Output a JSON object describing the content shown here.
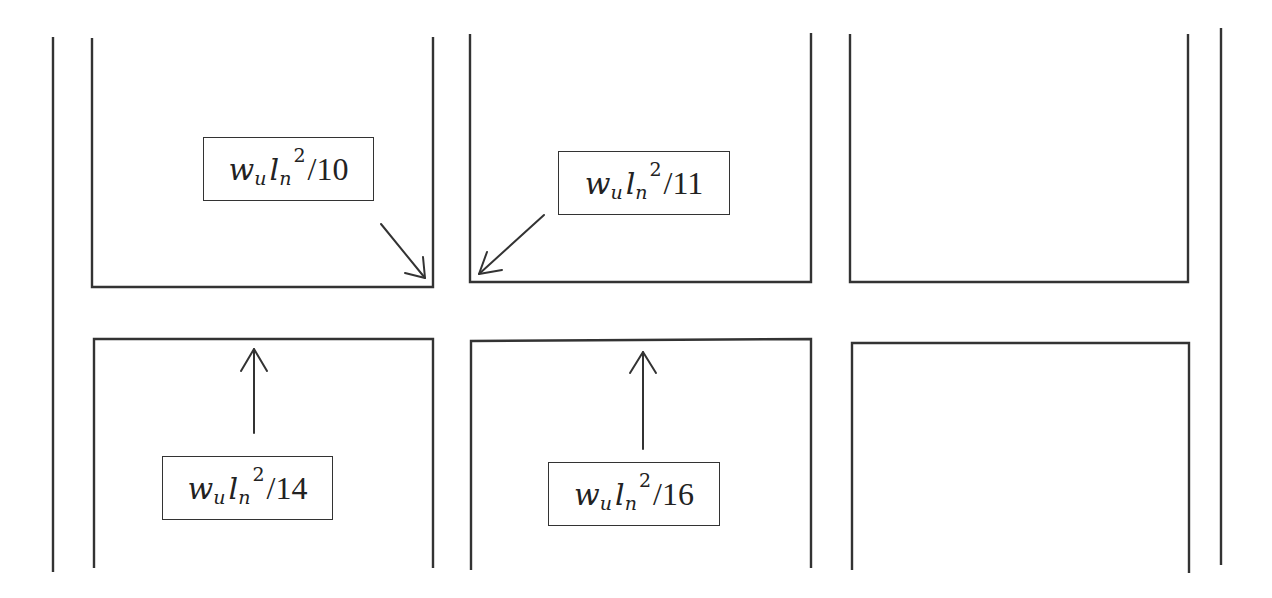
{
  "diagram": {
    "title": "",
    "moment_labels": [
      {
        "id": "top-left-negative",
        "w": "w",
        "w_sub": "u",
        "l": "l",
        "l_sub": "n",
        "exp": "2",
        "divisor": "/10",
        "text": "w_u l_n^2/10"
      },
      {
        "id": "top-middle-negative",
        "w": "w",
        "w_sub": "u",
        "l": "l",
        "l_sub": "n",
        "exp": "2",
        "divisor": "/11",
        "text": "w_u l_n^2/11"
      },
      {
        "id": "bottom-left-positive",
        "w": "w",
        "w_sub": "u",
        "l": "l",
        "l_sub": "n",
        "exp": "2",
        "divisor": "/14",
        "text": "w_u l_n^2/14"
      },
      {
        "id": "bottom-middle-positive",
        "w": "w",
        "w_sub": "u",
        "l": "l",
        "l_sub": "n",
        "exp": "2",
        "divisor": "/16",
        "text": "w_u l_n^2/16"
      }
    ],
    "colors": {
      "line": "#333333",
      "background": "#ffffff"
    }
  }
}
